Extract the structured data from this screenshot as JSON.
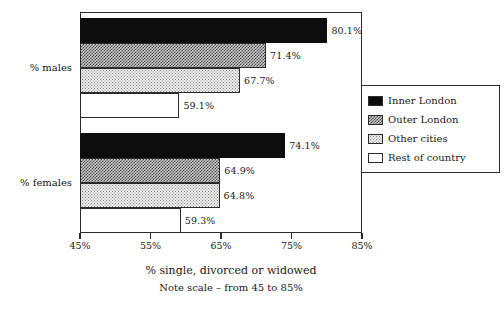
{
  "chart_data": {
    "type": "bar",
    "orientation": "horizontal",
    "title": "",
    "xlabel": "% single, divorced or widowed",
    "xlabel_note": "Note scale – from 45 to 85%",
    "ylabel": "",
    "categories": [
      "% males",
      "% females"
    ],
    "xlim": [
      45,
      85
    ],
    "xticks": [
      45,
      55,
      65,
      75,
      85
    ],
    "xtick_labels": [
      "45%",
      "55%",
      "65%",
      "75%",
      "85%"
    ],
    "grid": false,
    "legend_position": "right",
    "series": [
      {
        "name": "Inner London",
        "fill": "solid-black",
        "values": [
          80.1,
          74.1
        ],
        "value_labels": [
          "80.1%",
          "74.1%"
        ]
      },
      {
        "name": "Outer London",
        "fill": "check-dense",
        "values": [
          71.4,
          64.9
        ],
        "value_labels": [
          "71.4%",
          "64.9%"
        ]
      },
      {
        "name": "Other cities",
        "fill": "dot-light",
        "values": [
          67.7,
          64.8
        ],
        "value_labels": [
          "67.7%",
          "64.8%"
        ]
      },
      {
        "name": "Rest of country",
        "fill": "white",
        "values": [
          59.1,
          59.3
        ],
        "value_labels": [
          "59.1%",
          "59.3%"
        ]
      }
    ]
  },
  "colors": {
    "ink": "#1a1a1a",
    "frame": "#2b2b2b",
    "background": "#ffffff",
    "series_inner_london": "#0d0d0d",
    "series_outer_london": "#c9c9c9",
    "series_other_cities": "#ececec",
    "series_rest_of_country": "#ffffff"
  }
}
